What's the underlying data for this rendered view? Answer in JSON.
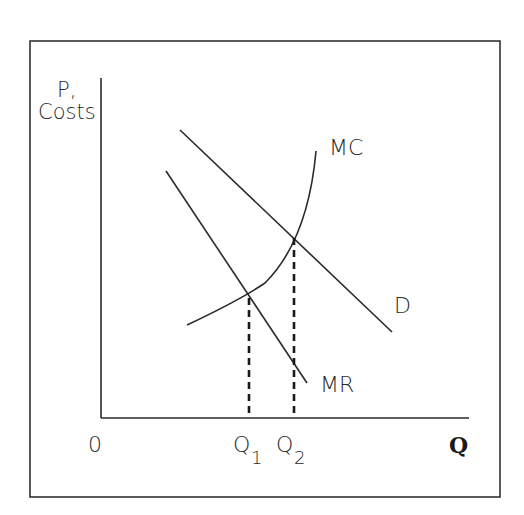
{
  "diagram": {
    "type": "economics-monopoly-cost-curves",
    "y_axis_label_line1": "P,",
    "y_axis_label_line2": "Costs",
    "x_axis_label": "Q",
    "origin_label": "0",
    "curves": [
      {
        "id": "MC",
        "label": "MC",
        "kind": "upward-sloping convex curve"
      },
      {
        "id": "D",
        "label": "D",
        "kind": "downward-sloping line"
      },
      {
        "id": "MR",
        "label": "MR",
        "kind": "downward-sloping line, steeper than D"
      }
    ],
    "quantity_markers": [
      {
        "label": "Q",
        "subscript": "1",
        "meaning": "MR = MC intersection"
      },
      {
        "label": "Q",
        "subscript": "2",
        "meaning": "D = MC intersection"
      }
    ],
    "colors": {
      "line": "#2a2a2a",
      "background": "#ffffff",
      "frame": "#333333"
    }
  }
}
